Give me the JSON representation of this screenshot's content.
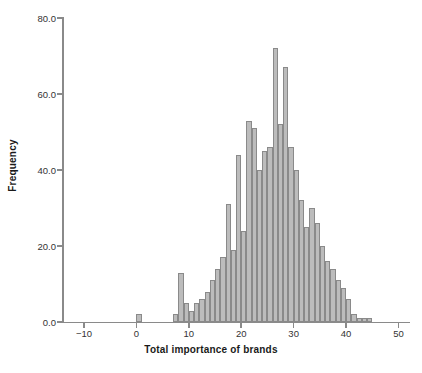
{
  "chart_data": {
    "type": "bar",
    "title": "",
    "subtitle": "",
    "xlabel": "Total importance of brands",
    "ylabel": "Frequency",
    "xlim": [
      -14,
      52
    ],
    "ylim": [
      0,
      80
    ],
    "xticks": [
      -10,
      0,
      10,
      20,
      30,
      40,
      50
    ],
    "xtick_labels": [
      "-10",
      "0",
      "10",
      "20",
      "30",
      "40",
      "50"
    ],
    "yticks": [
      0,
      20,
      40,
      60,
      80
    ],
    "ytick_labels": [
      "0.0",
      "20.0",
      "40.0",
      "60.0",
      "80.0"
    ],
    "grid": false,
    "legend": "none",
    "bin_width": 1,
    "bar_fill_color": "#bcbcbc",
    "bar_edge_color": "#8a8a8a",
    "axis_color": "#8a8a8a",
    "text_color": "#333333",
    "categories": [
      "0",
      "7",
      "8",
      "9",
      "10",
      "11",
      "12",
      "13",
      "14",
      "15",
      "16",
      "17",
      "18",
      "19",
      "20",
      "21",
      "22",
      "23",
      "24",
      "25",
      "26",
      "27",
      "28",
      "29",
      "30",
      "31",
      "32",
      "33",
      "34",
      "35",
      "36",
      "37",
      "38",
      "39",
      "40",
      "41",
      "42",
      "43",
      "44"
    ],
    "x": [
      0,
      7,
      8,
      9,
      10,
      11,
      12,
      13,
      14,
      15,
      16,
      17,
      18,
      19,
      20,
      21,
      22,
      23,
      24,
      25,
      26,
      27,
      28,
      29,
      30,
      31,
      32,
      33,
      34,
      35,
      36,
      37,
      38,
      39,
      40,
      41,
      42,
      43,
      44
    ],
    "values": [
      2,
      2,
      13,
      5,
      3,
      5,
      6,
      8,
      11,
      14,
      17,
      31,
      19,
      44,
      24,
      53,
      51,
      40,
      45,
      46,
      72,
      52,
      67,
      46,
      40,
      32,
      25,
      30,
      26,
      20,
      16,
      14,
      11,
      9,
      6,
      2,
      1,
      1,
      1
    ],
    "annotations": []
  }
}
